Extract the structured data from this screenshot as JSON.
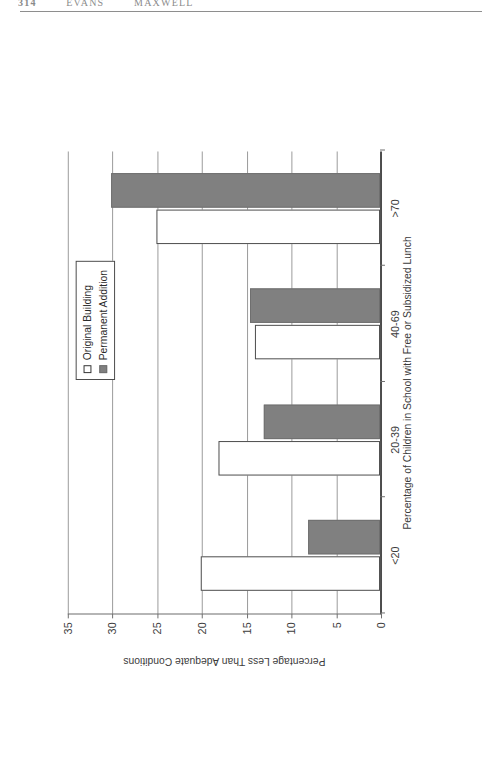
{
  "page_header": {
    "page_number": "314",
    "author_left": "EVANS",
    "author_right": "MAXWELL"
  },
  "legend": {
    "entries": [
      {
        "label": "Original Building",
        "swatch": "white-square-outline",
        "color": "#ffffff"
      },
      {
        "label": "Permanent Addition",
        "swatch": "gray-filled-square",
        "color": "#808080"
      }
    ]
  },
  "chart_data": {
    "type": "bar",
    "orientation": "horizontal",
    "title": "",
    "xlabel": "Percentage of Children in School with Free or Subsidized Lunch",
    "ylabel": "Percentage Less Than Adequate Conditions",
    "categories": [
      "<20",
      "20-39",
      "40-69",
      ">70"
    ],
    "series": [
      {
        "name": "Original Building",
        "values": [
          20,
          18,
          14,
          25
        ],
        "color": "#ffffff"
      },
      {
        "name": "Permanent Addition",
        "values": [
          8,
          13,
          14.5,
          30
        ],
        "color": "#808080"
      }
    ],
    "ylim": [
      0,
      35
    ],
    "tick_values": [
      0,
      5,
      10,
      15,
      20,
      25,
      30,
      35
    ],
    "tick_labels": [
      "0",
      "5",
      "10",
      "15",
      "20",
      "25",
      "30",
      "35"
    ],
    "grid": true,
    "legend_position": "top-center"
  }
}
